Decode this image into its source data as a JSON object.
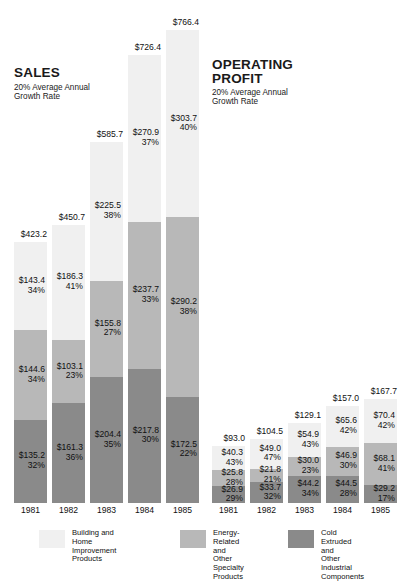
{
  "chart_data": {
    "type": "bar",
    "title": "",
    "subtitle": "",
    "xlabel": "",
    "ylabel": "",
    "grid": false,
    "legend_position": "bottom",
    "categories": [
      "1981",
      "1982",
      "1983",
      "1984",
      "1985"
    ],
    "series": [
      {
        "name": "Building and\nHome Improvement\nProducts",
        "key": "building",
        "color": "#f0f0f0"
      },
      {
        "name": "Energy-Related and\nOther Specialty\nProducts",
        "key": "energy",
        "color": "#b8b8b8"
      },
      {
        "name": "Cold Extruded and\nOther Industrial\nComponents",
        "key": "industrial",
        "color": "#8a8a8a"
      }
    ],
    "panels": [
      {
        "id": "sales",
        "heading": "SALES",
        "subheading": "20% Average Annual\nGrowth Rate",
        "unit": "$ millions",
        "bars": [
          {
            "year": "1981",
            "total": 423.2,
            "total_label": "$423.2",
            "segments": [
              {
                "series": "building",
                "value": 143.4,
                "value_label": "$143.4",
                "pct": 34,
                "pct_label": "34%"
              },
              {
                "series": "energy",
                "value": 144.6,
                "value_label": "$144.6",
                "pct": 34,
                "pct_label": "34%"
              },
              {
                "series": "industrial",
                "value": 135.2,
                "value_label": "$135.2",
                "pct": 32,
                "pct_label": "32%"
              }
            ]
          },
          {
            "year": "1982",
            "total": 450.7,
            "total_label": "$450.7",
            "segments": [
              {
                "series": "building",
                "value": 186.3,
                "value_label": "$186.3",
                "pct": 41,
                "pct_label": "41%"
              },
              {
                "series": "energy",
                "value": 103.1,
                "value_label": "$103.1",
                "pct": 23,
                "pct_label": "23%"
              },
              {
                "series": "industrial",
                "value": 161.3,
                "value_label": "$161.3",
                "pct": 36,
                "pct_label": "36%"
              }
            ]
          },
          {
            "year": "1983",
            "total": 585.7,
            "total_label": "$585.7",
            "segments": [
              {
                "series": "building",
                "value": 225.5,
                "value_label": "$225.5",
                "pct": 38,
                "pct_label": "38%"
              },
              {
                "series": "energy",
                "value": 155.8,
                "value_label": "$155.8",
                "pct": 27,
                "pct_label": "27%"
              },
              {
                "series": "industrial",
                "value": 204.4,
                "value_label": "$204.4",
                "pct": 35,
                "pct_label": "35%"
              }
            ]
          },
          {
            "year": "1984",
            "total": 726.4,
            "total_label": "$726.4",
            "segments": [
              {
                "series": "building",
                "value": 270.9,
                "value_label": "$270.9",
                "pct": 37,
                "pct_label": "37%"
              },
              {
                "series": "energy",
                "value": 237.7,
                "value_label": "$237.7",
                "pct": 33,
                "pct_label": "33%"
              },
              {
                "series": "industrial",
                "value": 217.8,
                "value_label": "$217.8",
                "pct": 30,
                "pct_label": "30%"
              }
            ]
          },
          {
            "year": "1985",
            "total": 766.4,
            "total_label": "$766.4",
            "segments": [
              {
                "series": "building",
                "value": 303.7,
                "value_label": "$303.7",
                "pct": 40,
                "pct_label": "40%"
              },
              {
                "series": "energy",
                "value": 290.2,
                "value_label": "$290.2",
                "pct": 38,
                "pct_label": "38%"
              },
              {
                "series": "industrial",
                "value": 172.5,
                "value_label": "$172.5",
                "pct": 22,
                "pct_label": "22%"
              }
            ]
          }
        ]
      },
      {
        "id": "operating-profit",
        "heading": "OPERATING\nPROFIT",
        "subheading": "20% Average Annual\nGrowth Rate",
        "unit": "$ millions",
        "bars": [
          {
            "year": "1981",
            "total": 93.0,
            "total_label": "$93.0",
            "segments": [
              {
                "series": "building",
                "value": 40.3,
                "value_label": "$40.3",
                "pct": 43,
                "pct_label": "43%"
              },
              {
                "series": "energy",
                "value": 25.8,
                "value_label": "$25.8",
                "pct": 28,
                "pct_label": "28%"
              },
              {
                "series": "industrial",
                "value": 26.9,
                "value_label": "$26.9",
                "pct": 29,
                "pct_label": "29%"
              }
            ]
          },
          {
            "year": "1982",
            "total": 104.5,
            "total_label": "$104.5",
            "segments": [
              {
                "series": "building",
                "value": 49.0,
                "value_label": "$49.0",
                "pct": 47,
                "pct_label": "47%"
              },
              {
                "series": "energy",
                "value": 21.8,
                "value_label": "$21.8",
                "pct": 21,
                "pct_label": "21%"
              },
              {
                "series": "industrial",
                "value": 33.7,
                "value_label": "$33.7",
                "pct": 32,
                "pct_label": "32%"
              }
            ]
          },
          {
            "year": "1983",
            "total": 129.1,
            "total_label": "$129.1",
            "segments": [
              {
                "series": "building",
                "value": 54.9,
                "value_label": "$54.9",
                "pct": 43,
                "pct_label": "43%"
              },
              {
                "series": "energy",
                "value": 30.0,
                "value_label": "$30.0",
                "pct": 23,
                "pct_label": "23%"
              },
              {
                "series": "industrial",
                "value": 44.2,
                "value_label": "$44.2",
                "pct": 34,
                "pct_label": "34%"
              }
            ]
          },
          {
            "year": "1984",
            "total": 157.0,
            "total_label": "$157.0",
            "segments": [
              {
                "series": "building",
                "value": 65.6,
                "value_label": "$65.6",
                "pct": 42,
                "pct_label": "42%"
              },
              {
                "series": "energy",
                "value": 46.9,
                "value_label": "$46.9",
                "pct": 30,
                "pct_label": "30%"
              },
              {
                "series": "industrial",
                "value": 44.5,
                "value_label": "$44.5",
                "pct": 28,
                "pct_label": "28%"
              }
            ]
          },
          {
            "year": "1985",
            "total": 167.7,
            "total_label": "$167.7",
            "segments": [
              {
                "series": "building",
                "value": 70.4,
                "value_label": "$70.4",
                "pct": 42,
                "pct_label": "42%"
              },
              {
                "series": "energy",
                "value": 68.1,
                "value_label": "$68.1",
                "pct": 41,
                "pct_label": "41%"
              },
              {
                "series": "industrial",
                "value": 29.2,
                "value_label": "$29.2",
                "pct": 17,
                "pct_label": "17%"
              }
            ]
          }
        ]
      }
    ],
    "legend": [
      {
        "label": "Building and\nHome Improvement\nProducts",
        "color": "#f0f0f0",
        "swatch": "light"
      },
      {
        "label": "Energy-Related and\nOther Specialty\nProducts",
        "color": "#b8b8b8",
        "swatch": "mid"
      },
      {
        "label": "Cold Extruded and\nOther Industrial\nComponents",
        "color": "#8a8a8a",
        "swatch": "dark"
      }
    ]
  }
}
